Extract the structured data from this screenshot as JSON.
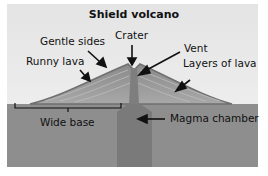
{
  "title": "Shield volcano",
  "labels": {
    "gentle_sides": "Gentle sides",
    "crater": "Crater",
    "vent": "Vent",
    "runny_lava": "Runny lava",
    "layers_of_lava": "Layers of lava",
    "wide_base": "Wide base",
    "magma_chamber": "Magma chamber"
  }
}
